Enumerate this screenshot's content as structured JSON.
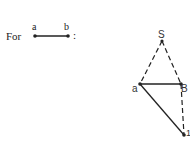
{
  "legend": {
    "prefix": "For",
    "start_label": "a",
    "end_label": "b",
    "suffix": ":"
  },
  "graph": {
    "vertices": [
      {
        "id": "S",
        "label": "S"
      },
      {
        "id": "a",
        "label": "a"
      },
      {
        "id": "B",
        "label": "B"
      },
      {
        "id": "bottom",
        "label": "1"
      }
    ],
    "edges": [
      {
        "from": "S",
        "to": "a",
        "style": "dashed"
      },
      {
        "from": "S",
        "to": "B",
        "style": "dashed"
      },
      {
        "from": "a",
        "to": "B",
        "style": "solid"
      },
      {
        "from": "a",
        "to": "bottom",
        "style": "solid"
      },
      {
        "from": "B",
        "to": "bottom",
        "style": "dashed"
      }
    ]
  },
  "colors": {
    "line": "#222222",
    "background": "#ffffff"
  }
}
